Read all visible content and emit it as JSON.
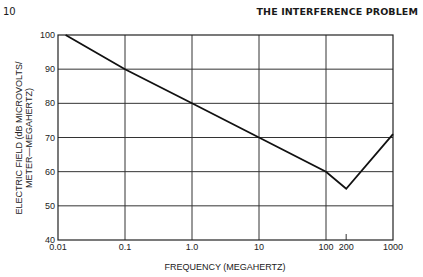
{
  "page": {
    "number": "10",
    "running_head": "THE INTERFERENCE PROBLEM"
  },
  "chart_data": {
    "type": "line",
    "title": "",
    "xlabel": "FREQUENCY (MEGAHERTZ)",
    "ylabel_line1": "ELECTRIC FIELD (dB MICROVOLTS/",
    "ylabel_line2": "METER—MEGAHERTZ)",
    "xscale": "log",
    "xlim": [
      0.01,
      1000
    ],
    "ylim": [
      40,
      100
    ],
    "grid": true,
    "x_ticks": [
      {
        "value": 0.01,
        "label": "0.01"
      },
      {
        "value": 0.1,
        "label": "0.1"
      },
      {
        "value": 1,
        "label": "1.0"
      },
      {
        "value": 10,
        "label": "10"
      },
      {
        "value": 100,
        "label": "100"
      },
      {
        "value": 200,
        "label": "200"
      },
      {
        "value": 1000,
        "label": "1000"
      }
    ],
    "y_ticks": [
      {
        "value": 40,
        "label": "40"
      },
      {
        "value": 50,
        "label": "50"
      },
      {
        "value": 60,
        "label": "60"
      },
      {
        "value": 70,
        "label": "70"
      },
      {
        "value": 80,
        "label": "80"
      },
      {
        "value": 90,
        "label": "90"
      },
      {
        "value": 100,
        "label": "100"
      }
    ],
    "series": [
      {
        "name": "Electric field",
        "x": [
          0.013,
          0.1,
          1,
          10,
          100,
          200,
          1000
        ],
        "y": [
          100,
          90,
          80,
          70,
          60,
          55,
          71
        ]
      }
    ],
    "line_color": "#111111"
  }
}
